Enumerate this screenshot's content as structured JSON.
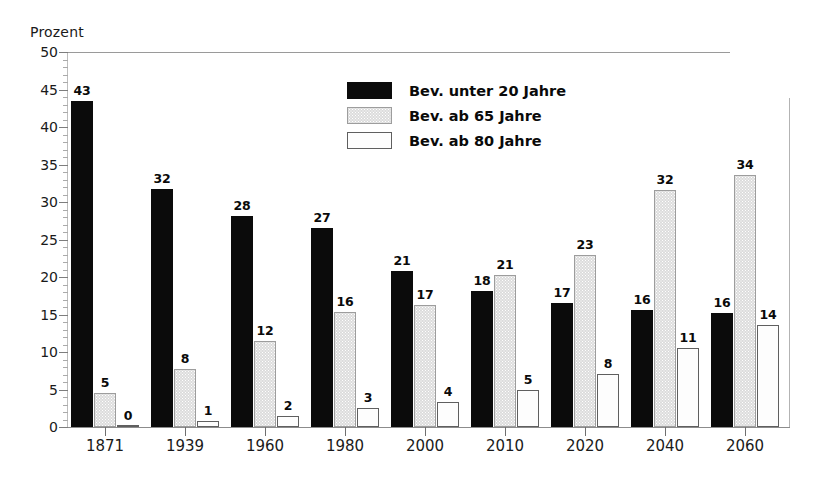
{
  "chart_data": {
    "type": "bar",
    "title": "",
    "ylabel": "Prozent",
    "xlabel": "",
    "ylim": [
      0,
      50
    ],
    "ytick_step": 5,
    "ytick_labels": [
      "0",
      "5",
      "10",
      "15",
      "20",
      "25",
      "30",
      "35",
      "40",
      "45",
      "50"
    ],
    "minor_ticks": true,
    "grid": false,
    "legend_position": "upper-center",
    "categories": [
      "1871",
      "1939",
      "1960",
      "1980",
      "2000",
      "2010",
      "2020",
      "2040",
      "2060"
    ],
    "series": [
      {
        "name": "Bev. unter 20 Jahre",
        "color": "#0b0b0b",
        "values": [
          43,
          32,
          28,
          27,
          21,
          18,
          17,
          16,
          16
        ],
        "plotted": [
          43.5,
          31.7,
          28.2,
          26.6,
          20.8,
          18.1,
          16.6,
          15.6,
          15.2
        ]
      },
      {
        "name": "Bev. ab 65 Jahre",
        "color": "#dcdcdc",
        "values": [
          5,
          8,
          12,
          16,
          17,
          21,
          23,
          32,
          34
        ],
        "plotted": [
          4.5,
          7.8,
          11.5,
          15.3,
          16.3,
          20.3,
          22.9,
          31.6,
          33.6
        ]
      },
      {
        "name": "Bev. ab 80 Jahre",
        "color": "#fdfdfd",
        "values": [
          0,
          1,
          2,
          3,
          4,
          5,
          8,
          11,
          14
        ],
        "plotted": [
          0.2,
          0.8,
          1.5,
          2.5,
          3.4,
          4.9,
          7.1,
          10.6,
          13.6
        ]
      }
    ]
  }
}
